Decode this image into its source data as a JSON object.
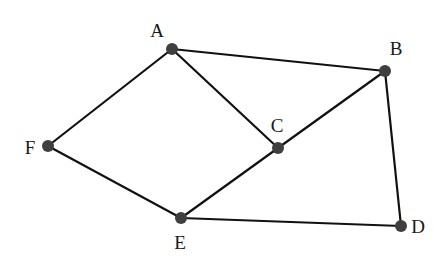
{
  "diagram": {
    "type": "graph",
    "nodes": [
      {
        "id": "A",
        "label": "A",
        "x": 172,
        "y": 49,
        "lx": 157,
        "ly": 37
      },
      {
        "id": "B",
        "label": "B",
        "x": 385,
        "y": 71,
        "lx": 396,
        "ly": 55
      },
      {
        "id": "C",
        "label": "C",
        "x": 278,
        "y": 148,
        "lx": 277,
        "ly": 132
      },
      {
        "id": "D",
        "label": "D",
        "x": 401,
        "y": 226,
        "lx": 418,
        "ly": 233
      },
      {
        "id": "E",
        "label": "E",
        "x": 181,
        "y": 218,
        "lx": 180,
        "ly": 249
      },
      {
        "id": "F",
        "label": "F",
        "x": 48,
        "y": 146,
        "lx": 30,
        "ly": 154
      }
    ],
    "edges": [
      {
        "from": "A",
        "to": "B"
      },
      {
        "from": "A",
        "to": "C"
      },
      {
        "from": "A",
        "to": "F"
      },
      {
        "from": "B",
        "to": "C"
      },
      {
        "from": "B",
        "to": "D"
      },
      {
        "from": "C",
        "to": "E"
      },
      {
        "from": "E",
        "to": "D"
      },
      {
        "from": "F",
        "to": "E"
      }
    ],
    "colors": {
      "edge": "#111111",
      "node": "#3f3f3f",
      "label": "#1a1a1a"
    }
  }
}
